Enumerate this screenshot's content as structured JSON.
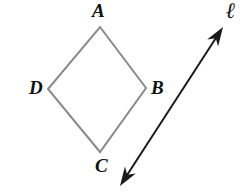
{
  "figure": {
    "background_color": "#ffffff",
    "width": 250,
    "height": 195
  },
  "shape": {
    "name": "rhombus",
    "stroke_color": "#8a8a8a",
    "stroke_width": 2,
    "fill": "none",
    "vertices": [
      {
        "label": "A",
        "x": 100,
        "y": 27,
        "position": "top"
      },
      {
        "label": "B",
        "x": 146,
        "y": 88,
        "position": "right"
      },
      {
        "label": "C",
        "x": 100,
        "y": 152,
        "position": "bottom"
      },
      {
        "label": "D",
        "x": 48,
        "y": 89,
        "position": "left"
      }
    ]
  },
  "line": {
    "label": "ℓ",
    "stroke_color": "#1a1a1a",
    "stroke_width": 2,
    "arrowheads": "both",
    "start": {
      "x": 120,
      "y": 186
    },
    "end": {
      "x": 223,
      "y": 27
    }
  },
  "labels": {
    "A": "A",
    "B": "B",
    "C": "C",
    "D": "D",
    "line": "ℓ"
  }
}
